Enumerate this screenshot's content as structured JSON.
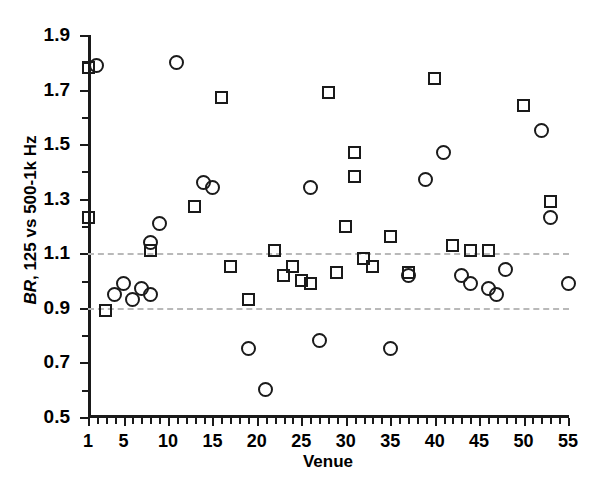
{
  "chart_data": {
    "type": "scatter",
    "title": "",
    "xlabel": "Venue",
    "ylabel": "BR, 125 vs 500-1k Hz",
    "ylabel_italic_prefix": "BR",
    "ylabel_rest": ", 125 vs 500-1k Hz",
    "xlim": [
      1,
      55
    ],
    "ylim": [
      0.5,
      1.9
    ],
    "xticks_major": [
      1,
      5,
      10,
      15,
      20,
      25,
      30,
      35,
      40,
      45,
      50,
      55
    ],
    "xtick_labels": [
      "1",
      "5",
      "10",
      "15",
      "20",
      "25",
      "30",
      "35",
      "40",
      "45",
      "50",
      "55"
    ],
    "xtick_minor_step": 1,
    "yticks_major": [
      0.5,
      0.7,
      0.9,
      1.1,
      1.3,
      1.5,
      1.7,
      1.9
    ],
    "ytick_labels": [
      "0.5",
      "0.7",
      "0.9",
      "1.1",
      "1.3",
      "1.5",
      "1.7",
      "1.9"
    ],
    "yticks_minor": [
      0.6,
      0.8,
      1.0,
      1.2,
      1.4,
      1.6,
      1.8
    ],
    "grid": false,
    "legend": "none",
    "reference_lines": [
      {
        "name": "upper-bound",
        "value": 1.1,
        "style": "dashed",
        "color": "#b9b9b9"
      },
      {
        "name": "lower-bound",
        "value": 0.9,
        "style": "dashed",
        "color": "#b9b9b9"
      }
    ],
    "marker_color": "#1a1a1a",
    "series": [
      {
        "name": "squares",
        "marker": "square",
        "points": [
          {
            "x": 1,
            "y": 1.78
          },
          {
            "x": 1,
            "y": 1.23
          },
          {
            "x": 3,
            "y": 0.89
          },
          {
            "x": 8,
            "y": 1.11
          },
          {
            "x": 13,
            "y": 1.27
          },
          {
            "x": 16,
            "y": 1.67
          },
          {
            "x": 17,
            "y": 1.05
          },
          {
            "x": 19,
            "y": 0.93
          },
          {
            "x": 22,
            "y": 1.11
          },
          {
            "x": 23,
            "y": 1.02
          },
          {
            "x": 24,
            "y": 1.05
          },
          {
            "x": 25,
            "y": 1.0
          },
          {
            "x": 26,
            "y": 0.99
          },
          {
            "x": 28,
            "y": 1.69
          },
          {
            "x": 29,
            "y": 1.03
          },
          {
            "x": 30,
            "y": 1.2
          },
          {
            "x": 31,
            "y": 1.47
          },
          {
            "x": 31,
            "y": 1.38
          },
          {
            "x": 32,
            "y": 1.08
          },
          {
            "x": 33,
            "y": 1.05
          },
          {
            "x": 35,
            "y": 1.16
          },
          {
            "x": 37,
            "y": 1.03
          },
          {
            "x": 40,
            "y": 1.74
          },
          {
            "x": 42,
            "y": 1.13
          },
          {
            "x": 44,
            "y": 1.11
          },
          {
            "x": 46,
            "y": 1.11
          },
          {
            "x": 50,
            "y": 1.64
          },
          {
            "x": 53,
            "y": 1.29
          }
        ]
      },
      {
        "name": "circles",
        "marker": "circle",
        "points": [
          {
            "x": 2,
            "y": 1.79
          },
          {
            "x": 4,
            "y": 0.95
          },
          {
            "x": 5,
            "y": 0.99
          },
          {
            "x": 6,
            "y": 0.93
          },
          {
            "x": 7,
            "y": 0.97
          },
          {
            "x": 8,
            "y": 0.95
          },
          {
            "x": 8,
            "y": 1.14
          },
          {
            "x": 9,
            "y": 1.21
          },
          {
            "x": 11,
            "y": 1.8
          },
          {
            "x": 14,
            "y": 1.36
          },
          {
            "x": 15,
            "y": 1.34
          },
          {
            "x": 19,
            "y": 0.75
          },
          {
            "x": 21,
            "y": 0.6
          },
          {
            "x": 26,
            "y": 1.34
          },
          {
            "x": 27,
            "y": 0.78
          },
          {
            "x": 35,
            "y": 0.75
          },
          {
            "x": 37,
            "y": 1.02
          },
          {
            "x": 39,
            "y": 1.37
          },
          {
            "x": 41,
            "y": 1.47
          },
          {
            "x": 43,
            "y": 1.02
          },
          {
            "x": 44,
            "y": 0.99
          },
          {
            "x": 46,
            "y": 0.97
          },
          {
            "x": 47,
            "y": 0.95
          },
          {
            "x": 48,
            "y": 1.04
          },
          {
            "x": 52,
            "y": 1.55
          },
          {
            "x": 53,
            "y": 1.23
          },
          {
            "x": 55,
            "y": 0.99
          }
        ]
      }
    ]
  }
}
